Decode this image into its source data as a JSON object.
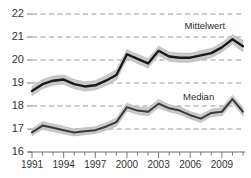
{
  "chart_data": {
    "type": "line",
    "title": "",
    "subtitle": "",
    "xlabel": "",
    "ylabel": "",
    "xlim": [
      1991,
      2011
    ],
    "ylim": [
      16,
      22
    ],
    "grid": true,
    "grid_style": "dashed-horizontal",
    "legend_position": "inline-annotation",
    "x": [
      1991,
      1992,
      1993,
      1994,
      1995,
      1996,
      1997,
      1998,
      1999,
      2000,
      2001,
      2002,
      2003,
      2004,
      2005,
      2006,
      2007,
      2008,
      2009,
      2010,
      2011
    ],
    "y_ticks": [
      16,
      17,
      18,
      19,
      20,
      21,
      22
    ],
    "y_tick_labels": [
      "16",
      "17",
      "18",
      "19",
      "20",
      "21",
      "22"
    ],
    "x_ticks": [
      1991,
      1992,
      1993,
      1994,
      1995,
      1996,
      1997,
      1998,
      1999,
      2000,
      2001,
      2002,
      2003,
      2004,
      2005,
      2006,
      2007,
      2008,
      2009,
      2010,
      2011
    ],
    "x_tick_labels_major": [
      "1991",
      "1994",
      "1997",
      "2000",
      "2003",
      "2006",
      "2009"
    ],
    "x_ticks_major": [
      1991,
      1994,
      1997,
      2000,
      2003,
      2006,
      2009
    ],
    "series": [
      {
        "name": "Mittelwert",
        "label": "Mittelwert",
        "color": "#1a1a1a",
        "band_color": "#c9c9c9",
        "label_x": 2008.3,
        "label_y": 21.45,
        "values": [
          18.65,
          18.95,
          19.1,
          19.15,
          18.95,
          18.85,
          18.9,
          19.1,
          19.35,
          20.25,
          20.05,
          19.85,
          20.4,
          20.15,
          20.1,
          20.1,
          20.2,
          20.3,
          20.55,
          20.9,
          20.6
        ],
        "band_upper": [
          18.85,
          19.15,
          19.3,
          19.35,
          19.15,
          19.05,
          19.1,
          19.32,
          19.58,
          20.45,
          20.25,
          20.05,
          20.6,
          20.35,
          20.3,
          20.3,
          20.4,
          20.5,
          20.75,
          21.1,
          20.85
        ],
        "band_lower": [
          18.45,
          18.75,
          18.9,
          18.95,
          18.75,
          18.65,
          18.7,
          18.88,
          19.12,
          20.05,
          19.85,
          19.65,
          20.2,
          19.95,
          19.9,
          19.9,
          20.0,
          20.1,
          20.35,
          20.7,
          20.35
        ]
      },
      {
        "name": "Median",
        "label": "Median",
        "color": "#3a3a3a",
        "band_color": "#c9c9c9",
        "label_x": 2007.4,
        "label_y": 18.35,
        "values": [
          16.85,
          17.15,
          17.05,
          16.95,
          16.85,
          16.9,
          16.95,
          17.1,
          17.3,
          17.95,
          17.8,
          17.75,
          18.1,
          17.9,
          17.8,
          17.6,
          17.45,
          17.7,
          17.75,
          18.3,
          17.75
        ],
        "band_upper": [
          17.0,
          17.32,
          17.22,
          17.12,
          17.0,
          17.05,
          17.1,
          17.26,
          17.48,
          18.12,
          17.96,
          17.92,
          18.28,
          18.06,
          17.96,
          17.76,
          17.62,
          17.86,
          17.92,
          18.46,
          17.94
        ],
        "band_lower": [
          16.7,
          16.98,
          16.88,
          16.78,
          16.7,
          16.75,
          16.8,
          16.94,
          17.12,
          17.78,
          17.64,
          17.58,
          17.92,
          17.74,
          17.64,
          17.44,
          17.28,
          17.54,
          17.58,
          18.14,
          17.56
        ]
      }
    ]
  },
  "axis": {
    "y_labels": [
      "22",
      "21",
      "20",
      "19",
      "18",
      "17",
      "16"
    ],
    "x_labels": [
      "1991",
      "1994",
      "1997",
      "2000",
      "2003",
      "2006",
      "2009"
    ]
  },
  "colors": {
    "line": "#1a1a1a",
    "band": "#c9c9c9",
    "grid": "#8c8c8c",
    "axis": "#6b6b6b",
    "text": "#333333",
    "background": "#ffffff"
  }
}
